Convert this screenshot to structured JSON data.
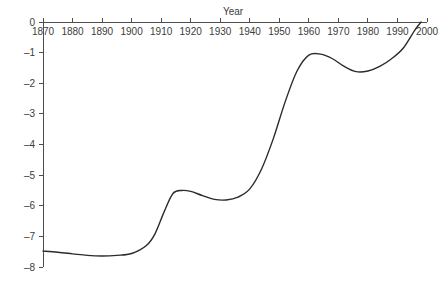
{
  "chart_data": {
    "type": "line",
    "title": "Year",
    "xlabel": "Year",
    "ylabel": "",
    "xlim": [
      1870,
      2000
    ],
    "ylim": [
      -8,
      0
    ],
    "grid": false,
    "legend": null,
    "x_axis_position": "top",
    "line_color": "#2b2b2b",
    "axis_color": "#4d4d4d",
    "xticks": [
      1870,
      1880,
      1890,
      1900,
      1910,
      1920,
      1930,
      1940,
      1950,
      1960,
      1970,
      1980,
      1990,
      2000
    ],
    "xtick_labels": [
      "1870",
      "1880",
      "1890",
      "1900",
      "1910",
      "1920",
      "1930",
      "1940",
      "1950",
      "1960",
      "1970",
      "1980",
      "1990",
      "2000"
    ],
    "yticks": [
      0,
      -1,
      -2,
      -3,
      -4,
      -5,
      -6,
      -7,
      -8
    ],
    "ytick_labels": [
      "0",
      "–1",
      "–2",
      "–3",
      "–4",
      "–5",
      "–6",
      "–7",
      "–8"
    ],
    "series": [
      {
        "name": "trend",
        "x": [
          1870,
          1875,
          1880,
          1885,
          1890,
          1895,
          1900,
          1905,
          1908,
          1911,
          1914,
          1917,
          1920,
          1924,
          1928,
          1932,
          1936,
          1940,
          1944,
          1948,
          1952,
          1956,
          1960,
          1964,
          1968,
          1972,
          1976,
          1980,
          1984,
          1988,
          1992,
          1996,
          1998
        ],
        "y": [
          -7.48,
          -7.52,
          -7.57,
          -7.62,
          -7.64,
          -7.62,
          -7.56,
          -7.3,
          -6.9,
          -6.2,
          -5.6,
          -5.5,
          -5.53,
          -5.67,
          -5.79,
          -5.81,
          -5.72,
          -5.45,
          -4.8,
          -3.8,
          -2.6,
          -1.6,
          -1.08,
          -1.05,
          -1.2,
          -1.45,
          -1.62,
          -1.6,
          -1.45,
          -1.2,
          -0.85,
          -0.25,
          0.0
        ]
      }
    ]
  }
}
